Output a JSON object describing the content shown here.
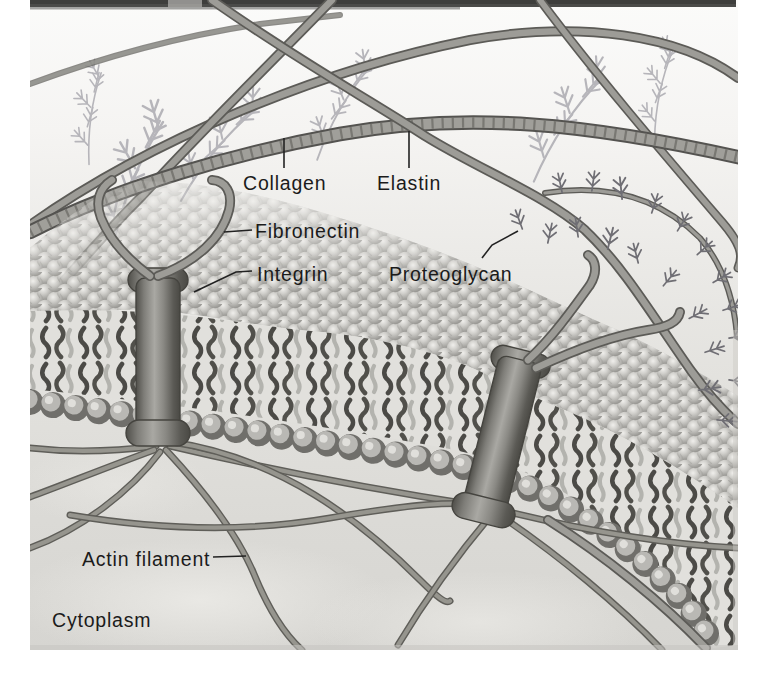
{
  "figure": {
    "labels": {
      "collagen": "Collagen",
      "elastin": "Elastin",
      "fibronectin": "Fibronectin",
      "integrin": "Integrin",
      "proteoglycan": "Proteoglycan",
      "actin_filament": "Actin filament",
      "cytoplasm": "Cytoplasm"
    },
    "colors": {
      "page_background": "#ffffff",
      "illustration_light": "#f7f6f4",
      "illustration_dark": "#d7d6d2",
      "membrane_sphere": "#b3b2ae",
      "lipid_tail": "#4b4a46",
      "fiber_gray": "#8f8e8a",
      "label_text": "#1b1b1b",
      "top_band": "#4a4a48"
    }
  }
}
